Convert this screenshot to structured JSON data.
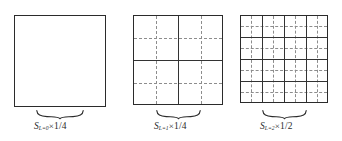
{
  "figure": {
    "width": 342,
    "height": 141,
    "background": "#ffffff",
    "solid_line_color": "#333333",
    "dashed_line_color": "#8d8d8d",
    "border_color": "#2b2b2b",
    "text_color": "#2b2b2b"
  },
  "panels": [
    {
      "id": "panel-level-0",
      "square": {
        "x": 14,
        "y": 15,
        "size": 92
      },
      "solid_divisions": 1,
      "dashed_divisions": 1,
      "brace": {
        "x": 36,
        "y": 110,
        "width": 48
      },
      "label": {
        "symbol": "S",
        "subscript": "L=0",
        "operator": "×",
        "value": "1/4",
        "full": "S(L=0) × 1/4"
      }
    },
    {
      "id": "panel-level-1",
      "square": {
        "x": 133,
        "y": 15,
        "size": 90
      },
      "solid_divisions": 2,
      "dashed_divisions": 4,
      "brace": {
        "x": 156,
        "y": 110,
        "width": 45
      },
      "label": {
        "symbol": "S",
        "subscript": "L=1",
        "operator": "×",
        "value": "1/4",
        "full": "S(L=1) × 1/4"
      }
    },
    {
      "id": "panel-level-2",
      "square": {
        "x": 240,
        "y": 15,
        "size": 88
      },
      "solid_divisions": 4,
      "dashed_divisions": 8,
      "brace": {
        "x": 262,
        "y": 110,
        "width": 45
      },
      "label": {
        "symbol": "S",
        "subscript": "L=2",
        "operator": "×",
        "value": "1/2",
        "full": "S(L=2) × 1/2"
      }
    }
  ]
}
